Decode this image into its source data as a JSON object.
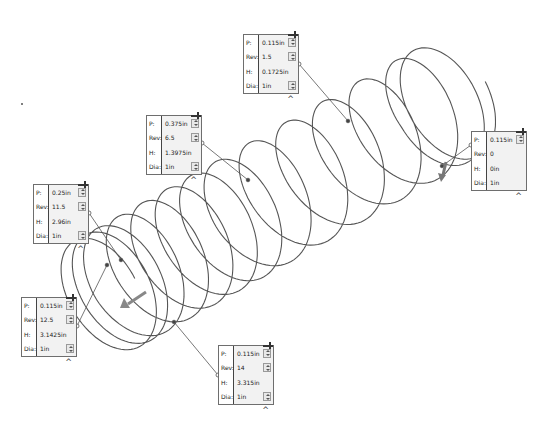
{
  "view": {
    "type": "CAD helix/spiral editing view",
    "helix": {
      "diameter": "1in",
      "stroke_color": "#555555",
      "revolutions_visible": 14
    }
  },
  "callouts": [
    {
      "id": "start",
      "rows": [
        {
          "label": "P:",
          "value": "0.115in",
          "spinner": true
        },
        {
          "label": "Rev:",
          "value": "0",
          "spinner": false
        },
        {
          "label": "H:",
          "value": "0in",
          "spinner": false
        },
        {
          "label": "Dia:",
          "value": "1in",
          "spinner": false
        }
      ]
    },
    {
      "id": "segment-1",
      "rows": [
        {
          "label": "P:",
          "value": "0.115in",
          "spinner": true
        },
        {
          "label": "Rev:",
          "value": "1.5",
          "spinner": true
        },
        {
          "label": "H:",
          "value": "0.1725in",
          "spinner": false
        },
        {
          "label": "Dia:",
          "value": "1in",
          "spinner": true
        }
      ]
    },
    {
      "id": "segment-2",
      "rows": [
        {
          "label": "P:",
          "value": "0.375in",
          "spinner": true
        },
        {
          "label": "Rev:",
          "value": "6.5",
          "spinner": true
        },
        {
          "label": "H:",
          "value": "1.3975in",
          "spinner": false
        },
        {
          "label": "Dia:",
          "value": "1in",
          "spinner": true
        }
      ]
    },
    {
      "id": "segment-3",
      "rows": [
        {
          "label": "P:",
          "value": "0.25in",
          "spinner": true
        },
        {
          "label": "Rev:",
          "value": "11.5",
          "spinner": true
        },
        {
          "label": "H:",
          "value": "2.96in",
          "spinner": false
        },
        {
          "label": "Dia:",
          "value": "1in",
          "spinner": true
        }
      ]
    },
    {
      "id": "segment-4",
      "rows": [
        {
          "label": "P:",
          "value": "0.115in",
          "spinner": true
        },
        {
          "label": "Rev:",
          "value": "12.5",
          "spinner": true
        },
        {
          "label": "H:",
          "value": "3.1425in",
          "spinner": false
        },
        {
          "label": "Dia:",
          "value": "1in",
          "spinner": true
        }
      ]
    },
    {
      "id": "end",
      "rows": [
        {
          "label": "P:",
          "value": "0.115in",
          "spinner": true
        },
        {
          "label": "Rev:",
          "value": "14",
          "spinner": true
        },
        {
          "label": "H:",
          "value": "3.315in",
          "spinner": false
        },
        {
          "label": "Dia:",
          "value": "1in",
          "spinner": true
        }
      ]
    }
  ],
  "icons": {
    "pin": "pin-icon",
    "collapse": "caret-up-icon",
    "spinner": "spinner-arrows-icon",
    "start_arrow": "direction-arrow-icon",
    "end_arrow": "direction-arrow-icon"
  }
}
